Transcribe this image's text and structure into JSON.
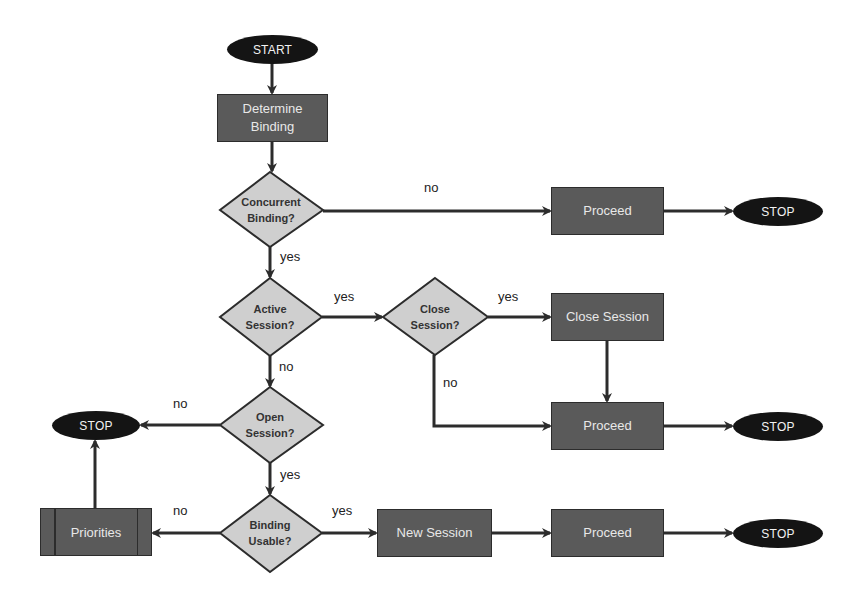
{
  "diagram": {
    "type": "flowchart",
    "colors": {
      "terminal_fill": "#141414",
      "process_fill": "#5a5a5a",
      "decision_fill": "#cfcfcf",
      "stroke": "#2c2c2c",
      "node_text": "#e8e8e8",
      "decision_text": "#333333"
    },
    "nodes": {
      "start": {
        "label": "START",
        "shape": "terminal"
      },
      "determine_binding": {
        "label": "Determine Binding",
        "shape": "process"
      },
      "concurrent_binding": {
        "label": "Concurrent Binding?",
        "shape": "decision"
      },
      "proceed_top": {
        "label": "Proceed",
        "shape": "process"
      },
      "stop_top": {
        "label": "STOP",
        "shape": "terminal"
      },
      "active_session": {
        "label": "Active Session?",
        "shape": "decision"
      },
      "close_session_q": {
        "label": "Close Session?",
        "shape": "decision"
      },
      "close_session": {
        "label": "Close Session",
        "shape": "process"
      },
      "proceed_mid": {
        "label": "Proceed",
        "shape": "process"
      },
      "stop_mid": {
        "label": "STOP",
        "shape": "terminal"
      },
      "open_session": {
        "label": "Open Session?",
        "shape": "decision"
      },
      "stop_left": {
        "label": "STOP",
        "shape": "terminal"
      },
      "binding_usable": {
        "label": "Binding Usable?",
        "shape": "decision"
      },
      "priorities": {
        "label": "Priorities",
        "shape": "predefined-process"
      },
      "new_session": {
        "label": "New Session",
        "shape": "process"
      },
      "proceed_bottom": {
        "label": "Proceed",
        "shape": "process"
      },
      "stop_bottom": {
        "label": "STOP",
        "shape": "terminal"
      }
    },
    "edge_labels": {
      "concurrent_no": "no",
      "concurrent_yes": "yes",
      "active_yes": "yes",
      "active_no": "no",
      "close_q_yes": "yes",
      "close_q_no": "no",
      "open_no": "no",
      "open_yes": "yes",
      "usable_no": "no",
      "usable_yes": "yes"
    },
    "edges": [
      {
        "from": "START",
        "to": "Determine Binding"
      },
      {
        "from": "Determine Binding",
        "to": "Concurrent Binding?"
      },
      {
        "from": "Concurrent Binding?",
        "to": "Proceed",
        "label": "no"
      },
      {
        "from": "Proceed",
        "to": "STOP"
      },
      {
        "from": "Concurrent Binding?",
        "to": "Active Session?",
        "label": "yes"
      },
      {
        "from": "Active Session?",
        "to": "Close Session?",
        "label": "yes"
      },
      {
        "from": "Close Session?",
        "to": "Close Session",
        "label": "yes"
      },
      {
        "from": "Close Session",
        "to": "Proceed"
      },
      {
        "from": "Close Session?",
        "to": "Proceed",
        "label": "no"
      },
      {
        "from": "Proceed",
        "to": "STOP"
      },
      {
        "from": "Active Session?",
        "to": "Open Session?",
        "label": "no"
      },
      {
        "from": "Open Session?",
        "to": "STOP",
        "label": "no"
      },
      {
        "from": "Open Session?",
        "to": "Binding Usable?",
        "label": "yes"
      },
      {
        "from": "Binding Usable?",
        "to": "Priorities",
        "label": "no"
      },
      {
        "from": "Priorities",
        "to": "STOP"
      },
      {
        "from": "Binding Usable?",
        "to": "New Session",
        "label": "yes"
      },
      {
        "from": "New Session",
        "to": "Proceed"
      },
      {
        "from": "Proceed",
        "to": "STOP"
      }
    ]
  }
}
